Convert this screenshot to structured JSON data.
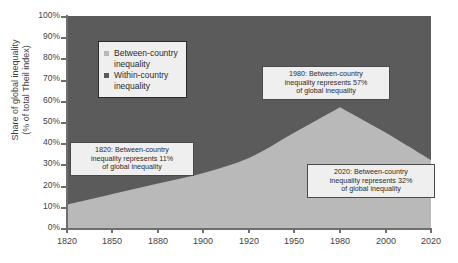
{
  "chart_data": {
    "type": "area",
    "stacked": true,
    "title": "",
    "xlabel": "",
    "ylabel": "Share of global inequality (% of total Theil index)",
    "ylabel_line1": "Share of global inequality",
    "ylabel_line2": "(% of total Theil index)",
    "ylim": [
      0,
      100
    ],
    "yticks": [
      "0%",
      "10%",
      "20%",
      "30%",
      "40%",
      "50%",
      "60%",
      "70%",
      "80%",
      "90%",
      "100%"
    ],
    "ytick_values": [
      0,
      10,
      20,
      30,
      40,
      50,
      60,
      70,
      80,
      90,
      100
    ],
    "xticks": [
      "1820",
      "1850",
      "1880",
      "1900",
      "1920",
      "1950",
      "1980",
      "2000",
      "2020"
    ],
    "grid": false,
    "legend_position": "upper-left-inside",
    "categories": [
      1820,
      1850,
      1880,
      1900,
      1920,
      1950,
      1980,
      2000,
      2020
    ],
    "series": [
      {
        "name": "Between-country inequality",
        "color": "#b9b9b9",
        "values": [
          11,
          16,
          21,
          26,
          33,
          45,
          57,
          45,
          32
        ]
      },
      {
        "name": "Within-country inequality",
        "color": "#5b5b5b",
        "values": [
          89,
          84,
          79,
          74,
          67,
          55,
          43,
          55,
          68
        ]
      }
    ],
    "annotations": [
      {
        "id": "1820",
        "year": 1820,
        "value": 11,
        "line1": "1820: Between-country",
        "line2": "inequality represents 11%",
        "line3": "of global inequality"
      },
      {
        "id": "1980",
        "year": 1980,
        "value": 57,
        "line1": "1980: Between-country",
        "line2": "inequality represents 57%",
        "line3": "of global inequality"
      },
      {
        "id": "2020",
        "year": 2020,
        "value": 32,
        "line1": "2020: Between-country",
        "line2": "inequality represents 32%",
        "line3": "of global inequality"
      }
    ]
  },
  "legend": {
    "items": [
      {
        "label_line1": "Between-country",
        "label_line2": "inequality",
        "swatch": "#b9b9b9"
      },
      {
        "label_line1": "Within-country",
        "label_line2": "inequality",
        "swatch": "#5b5b5b"
      }
    ]
  },
  "colors": {
    "plot_background": "#5b5b5b",
    "between_country": "#b9b9b9",
    "within_country": "#5b5b5b",
    "axis": "#6e6e6e",
    "text": "#3f3f3f",
    "callout_background": "#efefef",
    "callout_border": "#4a4a4a"
  }
}
